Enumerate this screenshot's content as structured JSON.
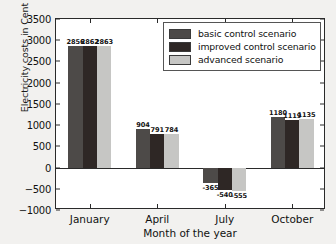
{
  "chart_data": {
    "type": "bar",
    "title": "",
    "xlabel": "Month of the year",
    "ylabel": "Electricity costs in Cent",
    "categories": [
      "January",
      "April",
      "July",
      "October"
    ],
    "series": [
      {
        "name": "basic control scenario",
        "color": "#4d4a48",
        "values": [
          2856,
          904,
          -365,
          1180
        ]
      },
      {
        "name": "improved control scenario",
        "color": "#2e2725",
        "values": [
          2862,
          791,
          -540,
          1119
        ]
      },
      {
        "name": "advanced scenario",
        "color": "#c6c6c4",
        "values": [
          2863,
          784,
          -555,
          1135
        ]
      }
    ],
    "ylim": [
      -1000,
      3500
    ],
    "yticks": [
      3500,
      3000,
      2500,
      2000,
      1500,
      1000,
      500,
      0,
      -500,
      -1000
    ],
    "ytick_labels": [
      "3500",
      "3000",
      "2500",
      "2000",
      "1500",
      "1000",
      "500",
      "0",
      "−500",
      "−1000"
    ],
    "grid": false,
    "legend_position": "upper right",
    "bar_labels": [
      [
        "2856",
        "2862",
        "2863"
      ],
      [
        "904",
        "791",
        "784"
      ],
      [
        "-365",
        "-540",
        "-555"
      ],
      [
        "1180",
        "1119",
        "1135"
      ]
    ]
  },
  "colors": {
    "figure_background": "#f2f1ef",
    "axes_background": "#ffffff",
    "axis_line": "#2a2a2a",
    "text": "#111111"
  }
}
